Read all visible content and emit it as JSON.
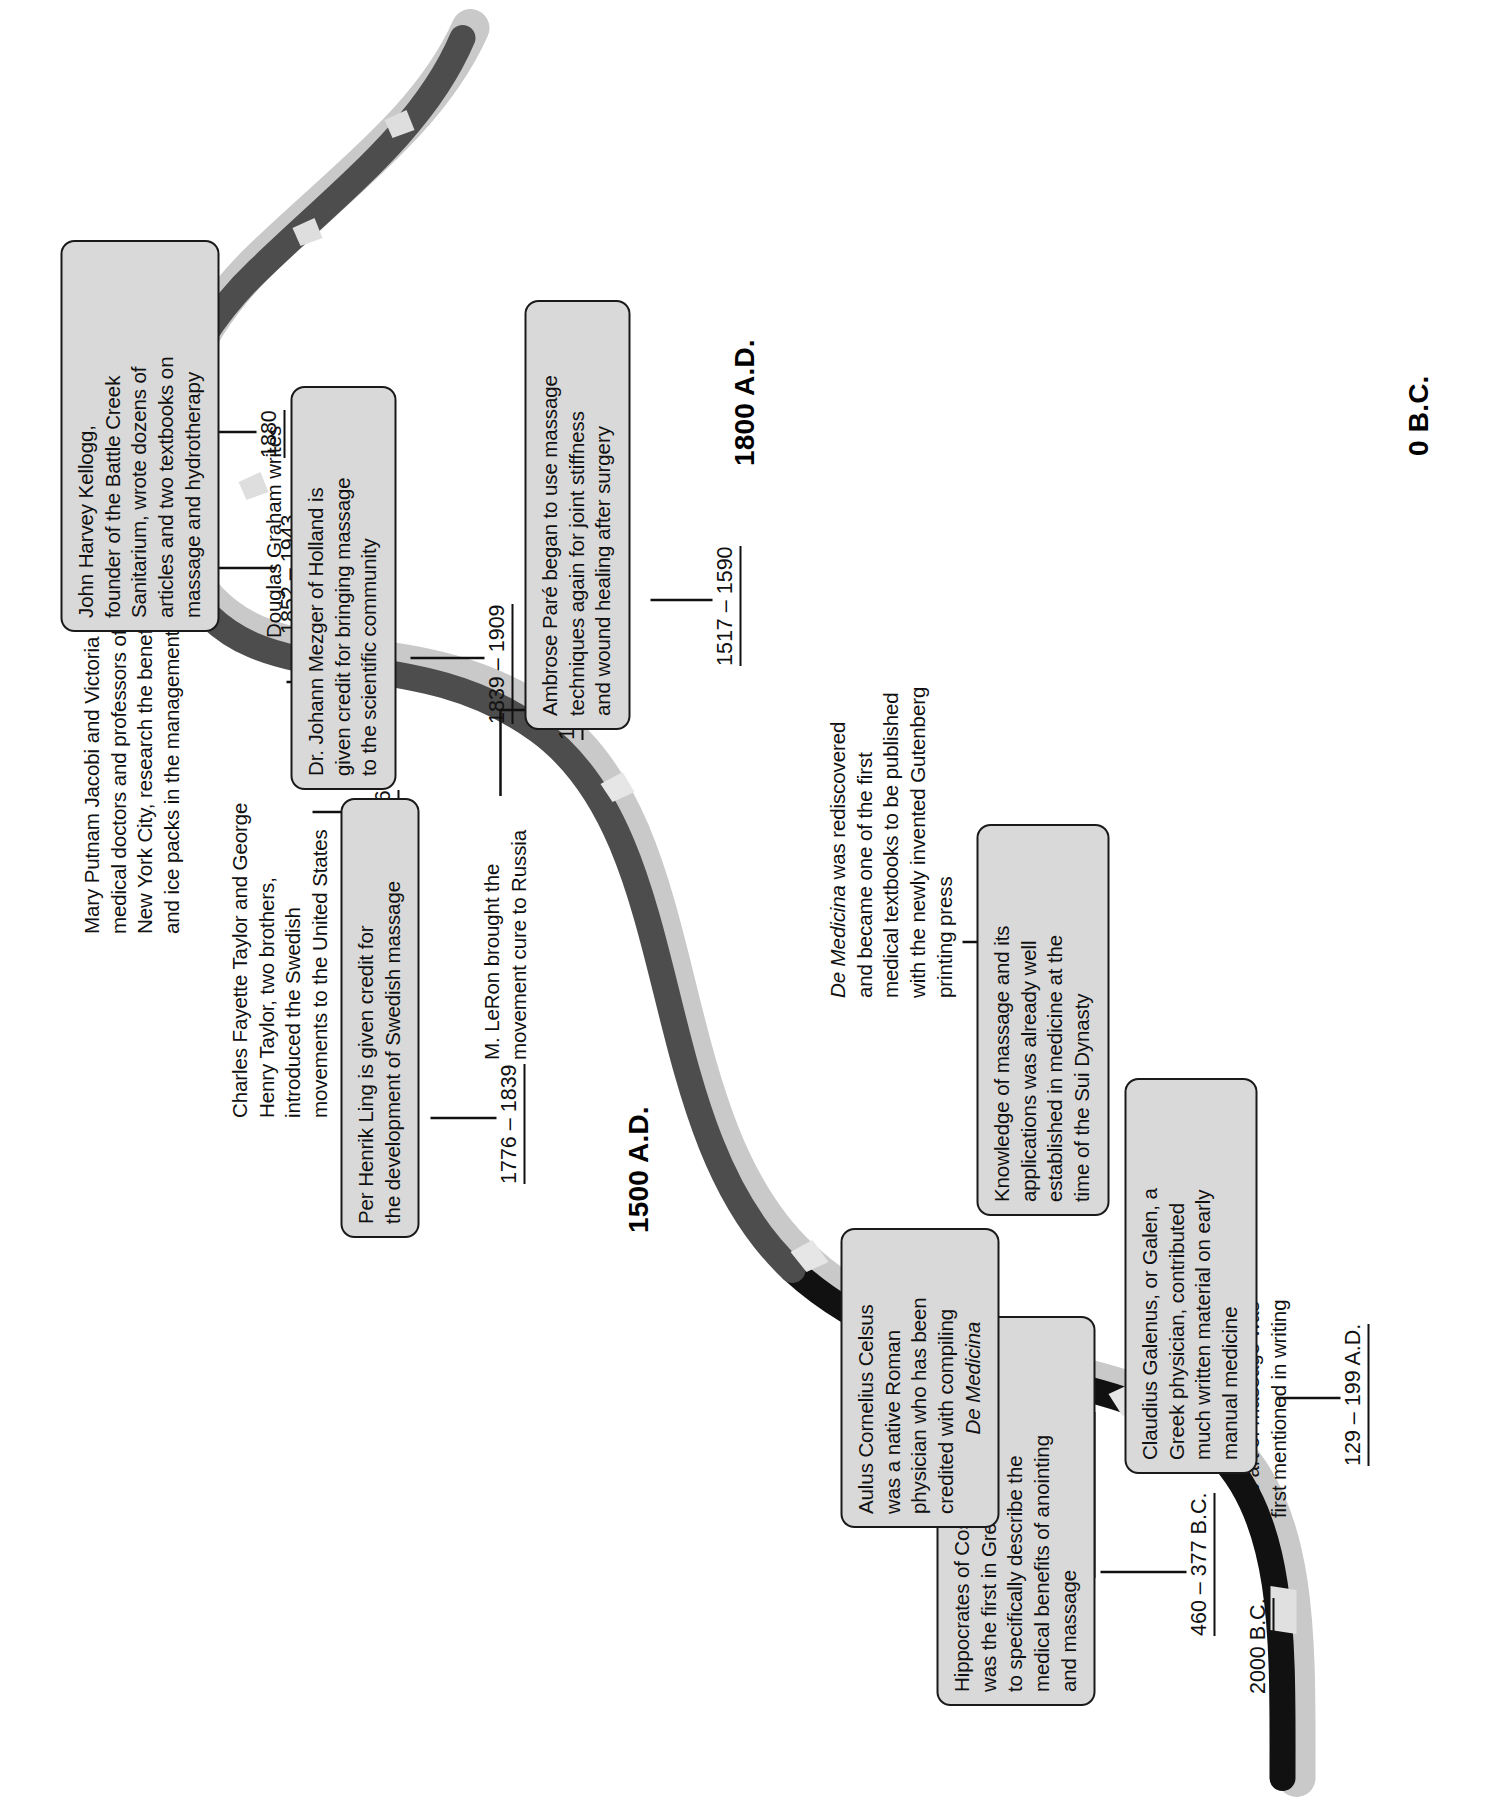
{
  "colors": {
    "ribbon_dark": "#4d4d4d",
    "ribbon_black": "#1a1a1a",
    "ribbon_shadow": "#c9c9c9",
    "box_fill": "#d9d9d9",
    "box_stroke": "#1a1a1a",
    "text": "#111111",
    "page_bg": "#ffffff"
  },
  "eras": [
    {
      "id": "era-0bc",
      "label": "0 B.C."
    },
    {
      "id": "era-1500",
      "label": "1500 A.D."
    },
    {
      "id": "era-1800",
      "label": "1800 A.D."
    }
  ],
  "entries": [
    {
      "id": "entry-2000bc",
      "date": "2000 B.C.",
      "kind": "note",
      "lines": [
        "The art of massage was",
        "first mentioned in writing"
      ]
    },
    {
      "id": "entry-460-377bc",
      "date": "460 – 377 B.C.",
      "kind": "callout",
      "lines": [
        "Hippocrates of Cos lived. He",
        "was the first in Greek medicine",
        "to specifically describe the",
        "medical benefits of anointing",
        "and massage"
      ]
    },
    {
      "id": "entry-25bc-50ad",
      "date": "25 B.C. – 50 A.D.",
      "kind": "callout",
      "lines": [
        "Aulus Cornelius Celsus",
        "was a native Roman",
        "physician who has been",
        "credited with compiling",
        "De Medicina"
      ],
      "italic_lines": [
        4
      ]
    },
    {
      "id": "entry-129-199ad",
      "date": "129 – 199 A.D.",
      "kind": "callout",
      "lines": [
        "Claudius Galenus, or Galen, a",
        "Greek physician, contributed",
        "much written material on early",
        "manual medicine"
      ]
    },
    {
      "id": "entry-589-617ad",
      "date": "589 – 617 A.D.",
      "kind": "callout",
      "lines": [
        "Knowledge of massage and its",
        "applications was already well",
        "established in medicine at the",
        "time of the Sui Dynasty"
      ]
    },
    {
      "id": "entry-1478ad",
      "date": "1478 A.D.",
      "kind": "note",
      "lines": [
        "De Medicina was rediscovered",
        "and became one of the first",
        "medical textbooks to be published",
        "with the newly invented Gutenberg",
        "printing press"
      ],
      "italic_prefix": "De Medicina"
    },
    {
      "id": "entry-1517-1590",
      "date": "1517 – 1590",
      "kind": "callout",
      "lines": [
        "Ambrose Paré began to use massage",
        "techniques again for joint stiffness",
        "and wound healing after surgery"
      ]
    },
    {
      "id": "entry-1776-1839",
      "date": "1776 – 1839",
      "kind": "callout",
      "lines": [
        "Per Henrik Ling is given credit for",
        "the development of Swedish massage"
      ]
    },
    {
      "id": "entry-1837",
      "date": "1837",
      "kind": "note",
      "lines": [
        "M. LeRon brought the",
        "movement cure to Russia"
      ]
    },
    {
      "id": "entry-1839-1909",
      "date": "1839 – 1909",
      "kind": "callout",
      "lines": [
        "Dr. Johann Mezger of Holland is",
        "given credit for bringing massage",
        "to the scientific community"
      ]
    },
    {
      "id": "entry-1852-1943",
      "date": "1852 – 1943",
      "kind": "callout",
      "lines": [
        "John Harvey Kellogg,",
        "founder of the Battle Creek",
        "Sanitarium, wrote dozens of",
        "articles and two textbooks on",
        "massage and hydrotherapy"
      ]
    },
    {
      "id": "entry-1856",
      "date": "1856",
      "kind": "note",
      "lines": [
        "Charles Fayette Taylor and George",
        "Henry Taylor, two brothers,",
        "introduced the Swedish",
        "movements to the United States"
      ]
    },
    {
      "id": "entry-1879",
      "date": "1879",
      "kind": "note",
      "lines": [
        "Douglas Graham writes",
        "a history of massage"
      ]
    },
    {
      "id": "entry-1880",
      "date": "1880",
      "kind": "note",
      "lines": [
        "Mary Putnam Jacobi and Victoria A. White,",
        "medical doctors and professors of medicine in",
        "New York City, research the benefits of massage",
        "and ice packs in the management of anemia"
      ]
    }
  ]
}
